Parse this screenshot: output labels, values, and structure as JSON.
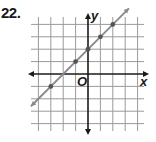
{
  "problem": {
    "number": "22."
  },
  "chart_data": {
    "type": "line",
    "title": "",
    "xlabel": "x",
    "ylabel": "y",
    "origin_label": "O",
    "xlim": [
      -4,
      4
    ],
    "ylim": [
      -4,
      4
    ],
    "grid": true,
    "legend": null,
    "series": [
      {
        "name": "line",
        "equation": "y = x + 2",
        "color": "#8a8a8a",
        "points": [
          {
            "x": -3,
            "y": -1
          },
          {
            "x": -1,
            "y": 1
          },
          {
            "x": 0,
            "y": 2
          },
          {
            "x": 1,
            "y": 3
          },
          {
            "x": 2,
            "y": 4
          }
        ]
      }
    ]
  },
  "colors": {
    "grid": "#9a9a9a",
    "axis": "#1a1a1a",
    "line": "#8a8a8a",
    "point": "#555555"
  }
}
